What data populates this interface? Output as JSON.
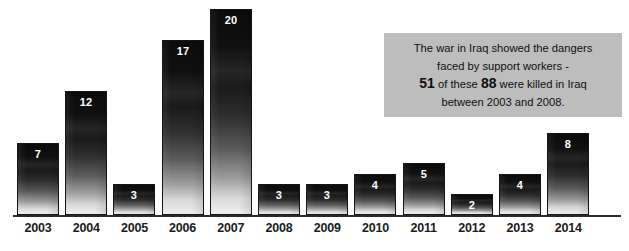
{
  "chart_data": {
    "type": "bar",
    "title": "",
    "subtitle": "",
    "xlabel": "",
    "ylabel": "",
    "ylim": [
      0,
      20
    ],
    "grid": false,
    "legend": "none",
    "categories": [
      "2003",
      "2004",
      "2005",
      "2006",
      "2007",
      "2008",
      "2009",
      "2010",
      "2011",
      "2012",
      "2013",
      "2014"
    ],
    "values": [
      7,
      12,
      3,
      17,
      20,
      3,
      3,
      4,
      5,
      2,
      4,
      8
    ],
    "value_labels": [
      "7",
      "12",
      "3",
      "17",
      "20",
      "3",
      "3",
      "4",
      "5",
      "2",
      "4",
      "8"
    ],
    "bar_style": "vertical gradient dark-to-light, black outline",
    "annotations": [
      {
        "name": "iraq-war-callout",
        "lines": [
          "The war in Iraq showed the dangers",
          "faced by support workers -",
          "51 of these 88 were killed in Iraq",
          "between 2003 and 2008."
        ],
        "emphasis": [
          "51",
          "88"
        ]
      }
    ]
  },
  "annotation": {
    "line1": "The war in Iraq showed the dangers",
    "line2": "faced by support workers -",
    "line3_num1": "51",
    "line3_mid": " of these ",
    "line3_num2": "88",
    "line3_tail": " were killed in Iraq",
    "line4": "between 2003 and 2008."
  },
  "colors": {
    "background": "#ffffff",
    "bar_top": "#0b0b0b",
    "bar_bottom": "#efefef",
    "bar_outline": "#151515",
    "axis": "#2b2b2b",
    "annotation_background": "#bdbdbd",
    "annotation_text": "#0f0f0f",
    "value_label": "#ffffff",
    "tick_label": "#1c1c1c"
  }
}
